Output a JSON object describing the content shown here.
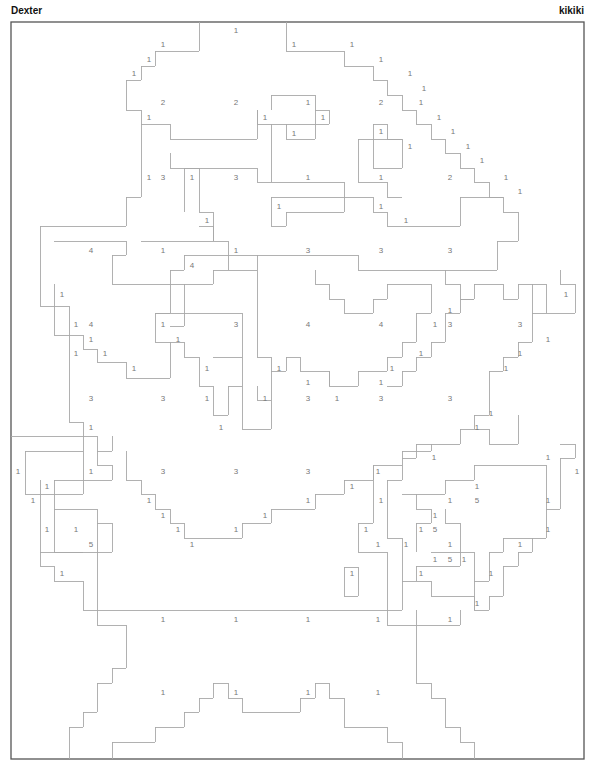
{
  "header": {
    "title_left": "Dexter",
    "title_right": "kikiki"
  },
  "colors": {
    "outline": "#a8a8a8",
    "number": "#777777",
    "frame": "#555555",
    "background": "#ffffff"
  },
  "frame": {
    "x": 11,
    "y": 22,
    "w": 573,
    "h": 737
  },
  "labels": [
    {
      "t": "1",
      "x": 236,
      "y": 30
    },
    {
      "t": "1",
      "x": 163,
      "y": 44
    },
    {
      "t": "1",
      "x": 294,
      "y": 44
    },
    {
      "t": "1",
      "x": 352,
      "y": 44
    },
    {
      "t": "1",
      "x": 149,
      "y": 59
    },
    {
      "t": "1",
      "x": 381,
      "y": 59
    },
    {
      "t": "1",
      "x": 134,
      "y": 73
    },
    {
      "t": "1",
      "x": 410,
      "y": 73
    },
    {
      "t": "1",
      "x": 424,
      "y": 88
    },
    {
      "t": "2",
      "x": 163,
      "y": 102
    },
    {
      "t": "2",
      "x": 236,
      "y": 102
    },
    {
      "t": "1",
      "x": 308,
      "y": 102
    },
    {
      "t": "2",
      "x": 381,
      "y": 102
    },
    {
      "t": "1",
      "x": 421,
      "y": 102
    },
    {
      "t": "1",
      "x": 149,
      "y": 117
    },
    {
      "t": "1",
      "x": 265,
      "y": 117
    },
    {
      "t": "1",
      "x": 323,
      "y": 117
    },
    {
      "t": "1",
      "x": 439,
      "y": 117
    },
    {
      "t": "1",
      "x": 381,
      "y": 131
    },
    {
      "t": "1",
      "x": 294,
      "y": 133
    },
    {
      "t": "1",
      "x": 453,
      "y": 131
    },
    {
      "t": "1",
      "x": 410,
      "y": 146
    },
    {
      "t": "1",
      "x": 468,
      "y": 146
    },
    {
      "t": "1",
      "x": 482,
      "y": 160
    },
    {
      "t": "1",
      "x": 149,
      "y": 177
    },
    {
      "t": "3",
      "x": 163,
      "y": 177
    },
    {
      "t": "1",
      "x": 192,
      "y": 177
    },
    {
      "t": "3",
      "x": 236,
      "y": 177
    },
    {
      "t": "1",
      "x": 308,
      "y": 177
    },
    {
      "t": "1",
      "x": 381,
      "y": 177
    },
    {
      "t": "2",
      "x": 450,
      "y": 177
    },
    {
      "t": "1",
      "x": 506,
      "y": 177
    },
    {
      "t": "1",
      "x": 520,
      "y": 191
    },
    {
      "t": "1",
      "x": 279,
      "y": 206
    },
    {
      "t": "1",
      "x": 381,
      "y": 206
    },
    {
      "t": "1",
      "x": 207,
      "y": 220
    },
    {
      "t": "1",
      "x": 406,
      "y": 220
    },
    {
      "t": "4",
      "x": 91,
      "y": 250
    },
    {
      "t": "1",
      "x": 163,
      "y": 250
    },
    {
      "t": "1",
      "x": 236,
      "y": 250
    },
    {
      "t": "3",
      "x": 308,
      "y": 250
    },
    {
      "t": "3",
      "x": 381,
      "y": 250
    },
    {
      "t": "3",
      "x": 450,
      "y": 250
    },
    {
      "t": "4",
      "x": 192,
      "y": 265
    },
    {
      "t": "1",
      "x": 62,
      "y": 294
    },
    {
      "t": "1",
      "x": 566,
      "y": 294
    },
    {
      "t": "1",
      "x": 450,
      "y": 310
    },
    {
      "t": "1",
      "x": 76,
      "y": 324
    },
    {
      "t": "4",
      "x": 91,
      "y": 324
    },
    {
      "t": "1",
      "x": 163,
      "y": 324
    },
    {
      "t": "3",
      "x": 236,
      "y": 324
    },
    {
      "t": "4",
      "x": 308,
      "y": 324
    },
    {
      "t": "4",
      "x": 381,
      "y": 324
    },
    {
      "t": "1",
      "x": 435,
      "y": 324
    },
    {
      "t": "3",
      "x": 450,
      "y": 324
    },
    {
      "t": "3",
      "x": 520,
      "y": 324
    },
    {
      "t": "1",
      "x": 91,
      "y": 339
    },
    {
      "t": "1",
      "x": 178,
      "y": 339
    },
    {
      "t": "1",
      "x": 548,
      "y": 339
    },
    {
      "t": "1",
      "x": 76,
      "y": 353
    },
    {
      "t": "1",
      "x": 105,
      "y": 353
    },
    {
      "t": "1",
      "x": 421,
      "y": 353
    },
    {
      "t": "1",
      "x": 520,
      "y": 353
    },
    {
      "t": "1",
      "x": 134,
      "y": 368
    },
    {
      "t": "1",
      "x": 207,
      "y": 368
    },
    {
      "t": "1",
      "x": 279,
      "y": 368
    },
    {
      "t": "1",
      "x": 392,
      "y": 368
    },
    {
      "t": "1",
      "x": 506,
      "y": 368
    },
    {
      "t": "1",
      "x": 308,
      "y": 382
    },
    {
      "t": "1",
      "x": 381,
      "y": 382
    },
    {
      "t": "3",
      "x": 91,
      "y": 398
    },
    {
      "t": "3",
      "x": 163,
      "y": 398
    },
    {
      "t": "1",
      "x": 207,
      "y": 398
    },
    {
      "t": "1",
      "x": 265,
      "y": 398
    },
    {
      "t": "3",
      "x": 308,
      "y": 398
    },
    {
      "t": "1",
      "x": 337,
      "y": 398
    },
    {
      "t": "3",
      "x": 381,
      "y": 398
    },
    {
      "t": "3",
      "x": 450,
      "y": 398
    },
    {
      "t": "1",
      "x": 491,
      "y": 413
    },
    {
      "t": "1",
      "x": 91,
      "y": 427
    },
    {
      "t": "1",
      "x": 221,
      "y": 427
    },
    {
      "t": "1",
      "x": 477,
      "y": 427
    },
    {
      "t": "1",
      "x": 434,
      "y": 457
    },
    {
      "t": "1",
      "x": 548,
      "y": 457
    },
    {
      "t": "1",
      "x": 18,
      "y": 471
    },
    {
      "t": "1",
      "x": 91,
      "y": 471
    },
    {
      "t": "3",
      "x": 163,
      "y": 471
    },
    {
      "t": "3",
      "x": 236,
      "y": 471
    },
    {
      "t": "3",
      "x": 308,
      "y": 471
    },
    {
      "t": "1",
      "x": 378,
      "y": 471
    },
    {
      "t": "1",
      "x": 577,
      "y": 471
    },
    {
      "t": "1",
      "x": 47,
      "y": 486
    },
    {
      "t": "1",
      "x": 352,
      "y": 486
    },
    {
      "t": "1",
      "x": 477,
      "y": 486
    },
    {
      "t": "1",
      "x": 33,
      "y": 500
    },
    {
      "t": "1",
      "x": 149,
      "y": 500
    },
    {
      "t": "1",
      "x": 308,
      "y": 500
    },
    {
      "t": "1",
      "x": 381,
      "y": 500
    },
    {
      "t": "1",
      "x": 450,
      "y": 500
    },
    {
      "t": "5",
      "x": 477,
      "y": 500
    },
    {
      "t": "1",
      "x": 548,
      "y": 500
    },
    {
      "t": "1",
      "x": 163,
      "y": 515
    },
    {
      "t": "1",
      "x": 265,
      "y": 515
    },
    {
      "t": "1",
      "x": 435,
      "y": 515
    },
    {
      "t": "1",
      "x": 47,
      "y": 529
    },
    {
      "t": "1",
      "x": 76,
      "y": 529
    },
    {
      "t": "1",
      "x": 178,
      "y": 529
    },
    {
      "t": "1",
      "x": 236,
      "y": 529
    },
    {
      "t": "1",
      "x": 366,
      "y": 529
    },
    {
      "t": "1",
      "x": 421,
      "y": 529
    },
    {
      "t": "5",
      "x": 435,
      "y": 529
    },
    {
      "t": "1",
      "x": 548,
      "y": 529
    },
    {
      "t": "5",
      "x": 91,
      "y": 544
    },
    {
      "t": "1",
      "x": 192,
      "y": 544
    },
    {
      "t": "1",
      "x": 378,
      "y": 544
    },
    {
      "t": "1",
      "x": 406,
      "y": 544
    },
    {
      "t": "1",
      "x": 450,
      "y": 544
    },
    {
      "t": "1",
      "x": 520,
      "y": 544
    },
    {
      "t": "1",
      "x": 435,
      "y": 559
    },
    {
      "t": "5",
      "x": 450,
      "y": 559
    },
    {
      "t": "1",
      "x": 464,
      "y": 559
    },
    {
      "t": "1",
      "x": 62,
      "y": 573
    },
    {
      "t": "1",
      "x": 352,
      "y": 573
    },
    {
      "t": "1",
      "x": 421,
      "y": 573
    },
    {
      "t": "1",
      "x": 491,
      "y": 573
    },
    {
      "t": "1",
      "x": 477,
      "y": 603
    },
    {
      "t": "1",
      "x": 163,
      "y": 619
    },
    {
      "t": "1",
      "x": 236,
      "y": 619
    },
    {
      "t": "1",
      "x": 308,
      "y": 619
    },
    {
      "t": "1",
      "x": 378,
      "y": 619
    },
    {
      "t": "1",
      "x": 450,
      "y": 619
    },
    {
      "t": "1",
      "x": 163,
      "y": 692
    },
    {
      "t": "1",
      "x": 236,
      "y": 692
    },
    {
      "t": "1",
      "x": 308,
      "y": 692
    },
    {
      "t": "1",
      "x": 378,
      "y": 692
    }
  ],
  "outlines": [
    "199,22 199,51 155,51 155,66 141,66 141,80 126,80 126,110 141,110 141,124 170,124 170,139 257,139 257,110",
    "286,22 286,51 344,51 344,66 373,66 373,80 387,80 387,95 402,95 402,110 416,110 416,124 431,124 431,139 445,139 445,153 460,153 460,168 474,168 474,182 489,182 489,197 503,197 503,212 518,212",
    "141,124 141,197 126,197 126,226 40,226 40,306 54,306 54,335",
    "170,153 170,168 257,168 257,182 344,182 344,197 373,197 373,212 387,212 387,226 460,226 460,197 503,197",
    "271,110 271,95 315,95 315,139 286,139 286,124",
    "257,110 257,124 329,124 329,110 315,110",
    "271,124 271,182",
    "373,124 373,168 402,168 402,139 387,139 387,124 373,124",
    "358,139 402,139",
    "358,139 358,168",
    "358,168 358,182 387,182 387,197 402,197",
    "271,197 344,197 344,212 286,212 286,226 271,226 271,197",
    "184,168 199,168 199,212 213,212 213,241 228,241 228,255 257,255 257,255",
    "184,168 184,212",
    "141,241 213,241 213,226 199,226",
    "54,241 126,241 126,255 112,255 112,284 170,284 170,270 184,270 184,255 228,255 228,270 213,270 213,284 170,284 170,313 155,313 155,342",
    "257,255 358,255 358,270 497,270 497,241 518,241 518,212",
    "228,270 242,270 242,270 257,270 257,255",
    "54,284 54,306 69,306 69,335 83,335 83,349 97,349 97,362 126,362 126,378 170,378 170,342",
    "155,313 242,313 242,357 213,357",
    "184,284 184,326 170,326",
    "257,270 257,357 271,357 271,400 257,400 257,386",
    "155,342 184,342 184,357 199,357 199,386 213,386 213,415 228,415 228,386 242,386 242,357",
    "315,270 315,284 329,284 329,299 344,299 344,313 373,313 373,299 387,299 387,284 431,284 431,313 416,313 416,342 402,342 402,357 387,357 387,371 358,371 358,386 329,386 329,371 300,371 300,357 286,357 286,371 271,371",
    "445,270 445,284 460,284 460,299 474,299 474,284 503,284 503,299 518,299 518,284 546,284 546,313 532,313",
    "474,299 460,299 460,313 445,313 445,342 431,342 431,357 416,357 416,371 402,371 402,386 387,386",
    "329,386 329,371",
    "532,284 532,342 518,342 518,357 503,357 503,371 489,371 489,415 474,415 474,429 460,429 460,444 416,444 416,458 402,458",
    "546,313 575,313 575,284 560,284 560,270",
    "54,335 69,335 69,422 83,422 83,436 97,436 97,451 112,451",
    "242,386 242,429 271,429 271,400",
    "474,429 489,429 489,444 518,444 518,415",
    "11,436 83,436 83,451 25,451 25,494 83,494 83,451",
    "112,436 112,451",
    "126,451 126,480 141,480 141,494 155,494 155,509 170,509 170,523 184,523 184,538 242,538 242,523 271,523 271,509 315,509 315,494 344,494 344,480 373,480 373,465 402,465 402,451 431,451 431,444",
    "560,444 575,444 575,458 560,458 560,509 546,509",
    "402,465 402,480 387,480 387,494",
    "54,480 112,480 112,465 97,465 97,451",
    "54,480 54,509 97,509 97,538",
    "40,480 40,566 54,566 54,581 83,581 83,610 387,610",
    "54,509 54,552 83,552",
    "97,523 112,523 112,552 40,552",
    "97,538 97,625 126,625 126,668 112,668 112,683 97,683 97,712 83,712 83,727 69,727 69,759",
    "344,567 358,567 358,596 344,596 344,567",
    "373,465 373,523 358,523 358,552 387,552 387,610",
    "387,494 387,538 402,538 402,581 431,581 431,596 474,596 474,610",
    "402,494 416,494 416,509 431,509 431,523 416,523 416,552",
    "416,494 445,494 445,480 474,480 474,465 546,465 546,538 503,538 503,552 489,552 489,581 474,581",
    "445,509 445,523 460,523 460,566 416,566 416,581",
    "431,552 474,552 474,610 489,610 489,596 503,596 503,566 518,566 518,552 532,552 532,538",
    "402,581 402,610 387,610 387,625 402,625",
    "402,625 460,625 460,610",
    "416,610 416,625",
    "416,625 416,683 431,683 431,698 445,698 445,727 460,727 460,742 474,742 474,759",
    "112,759 112,742 155,742 155,727 184,727 184,712 199,712 199,698 213,698 213,683 228,683 228,698 242,698 242,712 300,712 300,698 315,698 315,683 329,683 329,698 344,698 344,727 387,727 387,742 402,742 402,759",
    "141,759 141,759"
  ]
}
